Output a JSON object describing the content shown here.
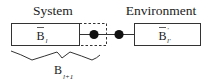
{
  "diagram": {
    "system_label": "System",
    "environment_label": "Environment",
    "system_block": {
      "symbol": "B",
      "overbar": true,
      "subscript": "l"
    },
    "environment_block": {
      "symbol": "B",
      "overbar": true,
      "prime": "'",
      "subscript": "l'"
    },
    "enlarged_block": {
      "symbol": "B",
      "subscript": "l+1"
    },
    "sites": [
      {
        "name": "site-1",
        "inside_dashed_box": true
      },
      {
        "name": "site-2",
        "inside_dashed_box": false
      }
    ],
    "colors": {
      "stroke": "#333333",
      "dot": "#111111",
      "text": "#222222"
    }
  }
}
